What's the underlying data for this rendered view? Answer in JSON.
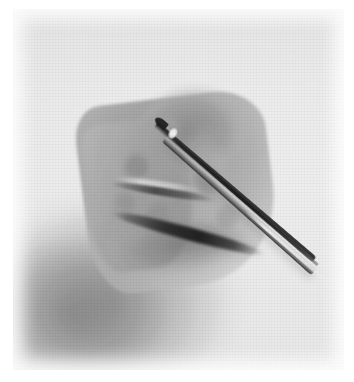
{
  "figure": {
    "domain": "natural-image",
    "media_type": "photograph",
    "rendering": "halftone-printed grayscale photograph (scanned)",
    "width_px": 354,
    "height_px": 382,
    "caption": "",
    "orientation": "portrait",
    "border": {
      "margin_left_px": 13,
      "margin_top_px": 9,
      "margin_right_px": 10,
      "margin_bottom_px": 12,
      "color": "#ffffff"
    }
  },
  "palette": {
    "page_background": "#ffffff",
    "plate_background": "#fbfbfb",
    "paper_highlight": "#ffffff",
    "midtone_gray": "#a8a8a8",
    "specimen_gray": "#9e9e9e",
    "shadow_gray": "#787878",
    "crack_black": "#141414",
    "instrument_black": "#1a1a1a",
    "specular_white": "#ffffff"
  },
  "subjects": [
    {
      "id": "specimen",
      "label": "specimen",
      "description": "Pale irregular wedge-shaped specimen occupying the centre of the frame, lighter on its upper-left face and fading into shadow toward the lower right.",
      "bbox": {
        "x": 70,
        "y": 88,
        "width": 190,
        "height": 190
      },
      "tone": "light gray"
    },
    {
      "id": "instrument",
      "label": "tweezers",
      "description": "Slender two-pronged metal tweezers, tip at upper left, shaft running diagonally down to the lower right edge of the frame, with a bright specular highlight near the tip and a long gleam along the shaft.",
      "tip": {
        "x": 143,
        "y": 113
      },
      "exit": {
        "x": 344,
        "y": 296
      },
      "angle_deg": 41,
      "tone": "near black with specular highlights"
    },
    {
      "id": "fracture",
      "label": "fracture line",
      "description": "Dark wedge-shaped crack crossing the lower portion of the specimen from left to right, widening toward the middle.",
      "bbox": {
        "x": 96,
        "y": 212,
        "width": 166,
        "height": 26
      },
      "tone": "black"
    },
    {
      "id": "background-shadow",
      "label": "cast shadow",
      "description": "Broad soft gray shadow spreading across the lower-left quadrant of the plate behind the specimen.",
      "bbox": {
        "x": 0,
        "y": 150,
        "width": 260,
        "height": 210
      },
      "tone": "medium gray"
    }
  ],
  "texture": {
    "pattern": "halftone dot screen",
    "dot_pitch_px": 2,
    "grain": "visible film / print grain"
  }
}
